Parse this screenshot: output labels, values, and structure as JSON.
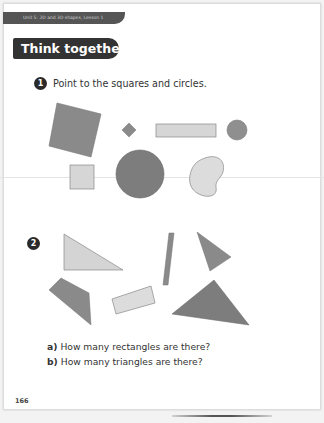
{
  "header": {
    "unit_banner": "Unit 5: 2D and 3D shapes, Lesson 1",
    "section_title": "Think together"
  },
  "questions": [
    {
      "number": "1",
      "prompt": "Point to the squares and circles.",
      "shapes": [
        {
          "type": "square",
          "orientation": "tilted",
          "fill": "#8a8a8a"
        },
        {
          "type": "square",
          "orientation": "diamond",
          "fill": "#8a8a8a"
        },
        {
          "type": "rectangle",
          "fill": "#d6d6d6"
        },
        {
          "type": "circle",
          "size": "small",
          "fill": "#8f8f8f"
        },
        {
          "type": "square",
          "fill": "#d6d6d6"
        },
        {
          "type": "circle",
          "size": "large",
          "fill": "#7d7d7d"
        },
        {
          "type": "blob",
          "fill": "#dcdcdc"
        }
      ]
    },
    {
      "number": "2",
      "prompt": "",
      "shapes": [
        {
          "type": "triangle",
          "variant": "right-angled",
          "fill": "#d4d4d4"
        },
        {
          "type": "rectangle",
          "variant": "thin-tilted",
          "fill": "#8a8a8a"
        },
        {
          "type": "triangle",
          "variant": "small",
          "fill": "#8a8a8a"
        },
        {
          "type": "quadrilateral",
          "variant": "irregular",
          "fill": "#8a8a8a"
        },
        {
          "type": "rectangle",
          "variant": "tilted",
          "fill": "#dcdcdc"
        },
        {
          "type": "triangle",
          "variant": "large",
          "fill": "#7d7d7d"
        }
      ],
      "sub_questions": [
        {
          "label": "a)",
          "text": "How many rectangles are there?"
        },
        {
          "label": "b)",
          "text": "How many triangles are there?"
        }
      ]
    }
  ],
  "footer": {
    "page_number": "166"
  },
  "colors": {
    "banner": "#555555",
    "pill": "#333333",
    "dark_shape": "#8a8a8a",
    "light_shape": "#d6d6d6"
  }
}
